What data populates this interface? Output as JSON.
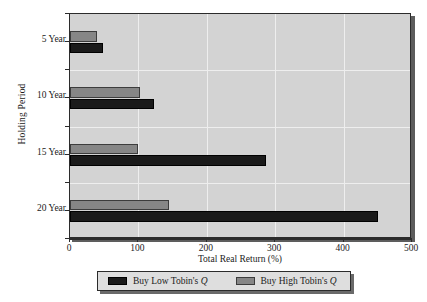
{
  "chart_data": {
    "type": "bar",
    "orientation": "horizontal",
    "title": "",
    "xlabel": "Total Real Return (%)",
    "ylabel": "Holding Period",
    "categories": [
      "5 Year",
      "10 Year",
      "15 Year",
      "20 Year"
    ],
    "xlim": [
      0,
      500
    ],
    "xticks": [
      0,
      100,
      200,
      300,
      400,
      500
    ],
    "xtick_labels": [
      "0",
      "100",
      "200",
      "300",
      "400",
      "500"
    ],
    "grid": true,
    "grid_axis": "both",
    "legend_position": "bottom",
    "series": [
      {
        "name": "Buy Low Tobin's Q",
        "color": "#1a1a1a",
        "values": [
          48,
          123,
          287,
          450
        ]
      },
      {
        "name": "Buy High Tobin's Q",
        "color": "#868686",
        "values": [
          40,
          103,
          100,
          145
        ]
      }
    ]
  },
  "axes": {
    "y_title": "Holding Period",
    "x_title": "Total Real Return (%)",
    "y_tick_labels": [
      "5 Year",
      "10 Year",
      "15 Year",
      "20 Year"
    ],
    "x_tick_labels": [
      "0",
      "100",
      "200",
      "300",
      "400",
      "500"
    ]
  },
  "legend": {
    "entries": [
      {
        "label_prefix": "Buy Low Tobin's ",
        "label_symbol": "Q",
        "swatch": "black-swatch-icon"
      },
      {
        "label_prefix": "Buy High Tobin's ",
        "label_symbol": "Q",
        "swatch": "gray-swatch-icon"
      }
    ]
  },
  "colors": {
    "plot_background": "#d3d3d3",
    "frame": "#2b2b2b",
    "gridline": "#eeeeee",
    "series_low": "#1a1a1a",
    "series_high": "#868686",
    "legend_background": "#dedede"
  }
}
